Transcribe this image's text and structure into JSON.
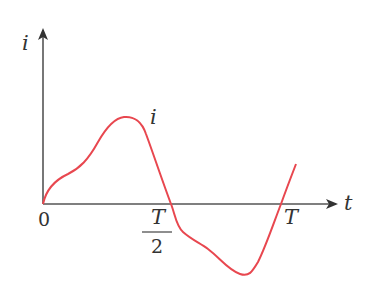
{
  "diagram": {
    "axes": {
      "y_label": "i",
      "x_label": "t",
      "origin_label": "0"
    },
    "ticks": {
      "half_period": {
        "numerator": "T",
        "denominator": "2"
      },
      "period": "T"
    },
    "curve_label": "i",
    "colors": {
      "curve": "#e8474f",
      "axes": "#444444"
    }
  }
}
